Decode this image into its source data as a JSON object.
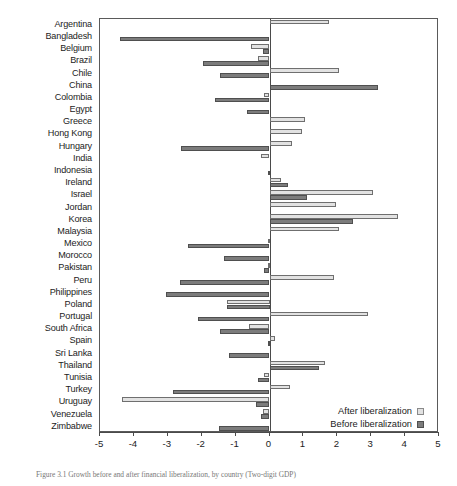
{
  "caption": "Figure 3.1 Growth before and after financial liberalization, by country (Two-digit GDP)",
  "legend": {
    "after_label": "After liberalization",
    "before_label": "Before liberalization",
    "after_color": "#e2e2e2",
    "before_color": "#7c7c7c"
  },
  "chart_data": {
    "type": "bar",
    "orientation": "horizontal",
    "title": "",
    "xlabel": "",
    "ylabel": "",
    "xlim": [
      -5,
      5
    ],
    "xticks": [
      -5,
      -4,
      -3,
      -2,
      -1,
      0,
      1,
      2,
      3,
      4,
      5
    ],
    "xtick_labels": [
      "-5",
      "-4",
      "-3",
      "-2",
      "-1",
      "0",
      "1",
      "2",
      "3",
      "4",
      "5"
    ],
    "grid": false,
    "legend_position": "bottom-right",
    "categories": [
      "Argentina",
      "Bangladesh",
      "Belgium",
      "Brazil",
      "Chile",
      "China",
      "Colombia",
      "Egypt",
      "Greece",
      "Hong Kong",
      "Hungary",
      "India",
      "Indonesia",
      "Ireland",
      "Israel",
      "Jordan",
      "Korea",
      "Malaysia",
      "Mexico",
      "Morocco",
      "Pakistan",
      "Peru",
      "Philippines",
      "Poland",
      "Portugal",
      "South Africa",
      "Spain",
      "Sri Lanka",
      "Thailand",
      "Tunisia",
      "Turkey",
      "Uruguay",
      "Venezuela",
      "Zimbabwe"
    ],
    "series": [
      {
        "name": "After liberalization",
        "color": "#e2e2e2",
        "values": [
          1.75,
          0.0,
          -0.55,
          -0.35,
          2.05,
          0.0,
          -0.15,
          0.0,
          1.05,
          0.95,
          0.65,
          -0.25,
          0.0,
          0.35,
          3.05,
          1.95,
          3.8,
          2.05,
          -0.05,
          0.0,
          -0.05,
          1.9,
          0.0,
          -1.25,
          2.9,
          -0.6,
          0.15,
          0.0,
          1.65,
          -0.15,
          0.6,
          -4.35,
          -0.2,
          0.0
        ]
      },
      {
        "name": "Before liberalization",
        "color": "#7c7c7c",
        "values": [
          0.0,
          -4.4,
          -0.2,
          -1.95,
          -1.45,
          3.2,
          -1.6,
          -0.65,
          0.0,
          0.0,
          -2.6,
          0.0,
          -0.05,
          0.55,
          1.1,
          0.0,
          2.45,
          0.0,
          -2.4,
          -1.35,
          -0.15,
          -2.65,
          -3.05,
          -1.25,
          -2.1,
          -1.45,
          -0.05,
          -1.2,
          1.45,
          -0.35,
          -2.85,
          -0.4,
          -0.25,
          -1.5
        ]
      }
    ]
  }
}
